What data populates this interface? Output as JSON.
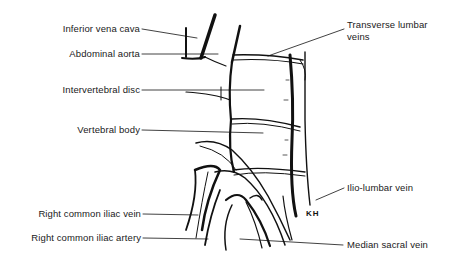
{
  "diagram": {
    "labels": [
      {
        "id": "ivc",
        "text": "Inferior vena cava",
        "side": "left"
      },
      {
        "id": "aorta",
        "text": "Abdominal aorta",
        "side": "left"
      },
      {
        "id": "disc",
        "text": "Intervertebral disc",
        "side": "left"
      },
      {
        "id": "body",
        "text": "Vertebral body",
        "side": "left"
      },
      {
        "id": "rciv",
        "text": "Right common iliac vein",
        "side": "left"
      },
      {
        "id": "rcia",
        "text": "Right common iliac artery",
        "side": "left"
      },
      {
        "id": "tlv",
        "text": "Transverse lumbar\nveins",
        "line1": "Transverse lumbar",
        "line2": "veins",
        "side": "right"
      },
      {
        "id": "ilv",
        "text": "Ilio-lumbar vein",
        "side": "right"
      },
      {
        "id": "msv",
        "text": "Median sacral vein",
        "side": "right"
      }
    ],
    "signature": "KH"
  },
  "colors": {
    "ink": "#111111",
    "background": "#ffffff"
  }
}
